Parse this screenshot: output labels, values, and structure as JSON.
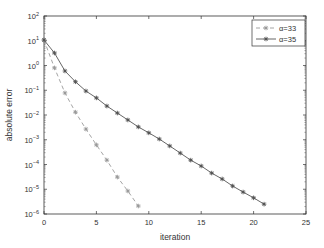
{
  "chart_data": {
    "type": "line",
    "title": "",
    "xlabel": "iteration",
    "ylabel": "absolute error",
    "yscale": "log",
    "xlim": [
      0,
      25
    ],
    "ylim": [
      1e-06,
      100
    ],
    "xticks": [
      0,
      5,
      10,
      15,
      20,
      25
    ],
    "xtick_labels": [
      "0",
      "5",
      "10",
      "15",
      "20",
      "25"
    ],
    "yticks_exp": [
      2,
      1,
      0,
      -1,
      -2,
      -3,
      -4,
      -5,
      -6
    ],
    "ytick_labels": [
      "10^2",
      "10^1",
      "10^0",
      "10^-1",
      "10^-2",
      "10^-3",
      "10^-4",
      "10^-5",
      "10^-6"
    ],
    "grid": false,
    "legend_position": "upper right",
    "series": [
      {
        "name": "α=33",
        "line_style": "dashed",
        "marker": "star",
        "color": "#9a9a9a",
        "x": [
          0,
          1,
          2,
          3,
          4,
          5,
          6,
          7,
          8,
          9
        ],
        "values": [
          10.7,
          0.8,
          0.078,
          0.013,
          0.0027,
          0.00062,
          0.00015,
          3.1e-05,
          8.5e-06,
          2.1e-06
        ]
      },
      {
        "name": "α=35",
        "line_style": "solid",
        "marker": "star",
        "color": "#555555",
        "x": [
          0,
          1,
          2,
          3,
          4,
          5,
          6,
          7,
          8,
          9,
          10,
          11,
          12,
          13,
          14,
          15,
          16,
          17,
          18,
          19,
          20,
          21
        ],
        "values": [
          10.7,
          3.2,
          0.6,
          0.22,
          0.093,
          0.049,
          0.023,
          0.012,
          0.0063,
          0.0033,
          0.0019,
          0.00107,
          0.00056,
          0.00029,
          0.00015,
          8.7e-05,
          4.5e-05,
          2.6e-05,
          1.35e-05,
          7.7e-06,
          4.5e-06,
          2.5e-06
        ]
      }
    ]
  }
}
